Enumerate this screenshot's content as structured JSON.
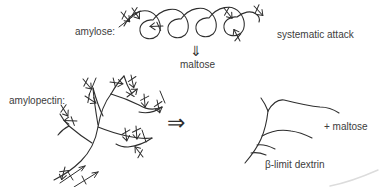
{
  "figure": {
    "colors": {
      "background": "#ffffff",
      "ink": "#2e2e2e",
      "text": "#3c3c3c"
    },
    "labels": {
      "amylose": "amylose:",
      "systematic_attack": "systematic attack",
      "maltose": "maltose",
      "amylopectin": "amylopectin:",
      "plus_maltose": "+ maltose",
      "beta_limit_dextrin": "β-limit dextrin"
    },
    "glyphs": {
      "down_double_arrow": "⇓",
      "right_double_arrow": "⇒"
    }
  }
}
